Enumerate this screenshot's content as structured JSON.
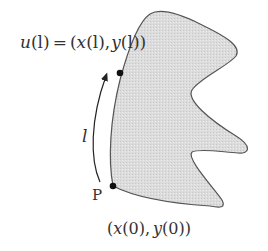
{
  "diagram": {
    "curve_label": "u(l) = (x(l), y(l))",
    "curve_label_parts": {
      "u": "u",
      "arg1": "(l)",
      "eq": "=",
      "open": "(",
      "x": "x",
      "arg2": "(l)",
      "comma": ",",
      "y": "y",
      "arg3": "(l)",
      "close": ")"
    },
    "arc_length_label": "l",
    "start_point_label": "P",
    "start_coords_label": "(x(0), y(0))",
    "start_coords_parts": {
      "open": "(",
      "x": "x",
      "arg1": "(0)",
      "comma": ",",
      "y": "y",
      "arg2": "(0)",
      "close": ")"
    },
    "colors": {
      "shape_fill": "#d9d9d9",
      "shape_stroke": "#555555",
      "text": "#333333",
      "point": "#111111"
    }
  }
}
